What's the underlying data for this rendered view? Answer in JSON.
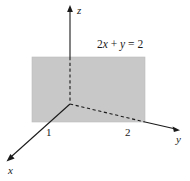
{
  "figure": {
    "kind": "3d-coordinate-plane-diagram",
    "background_color": "#ffffff",
    "ink_color": "#1a1a1a",
    "plane_fill_color": "#c8c8c8",
    "plane_edge_color": "#b4b4b4"
  },
  "axes": [
    {
      "id": "z",
      "label": "z",
      "orientation": "vertical-up",
      "solid_from": [
        70,
        104
      ],
      "solid_to": [
        70,
        57
      ],
      "dashed_from": [
        70,
        57
      ],
      "dashed_to": [
        70,
        103
      ],
      "arrow_tip": [
        70,
        6
      ],
      "label_position": [
        77,
        5
      ]
    },
    {
      "id": "y",
      "label": "y",
      "orientation": "right-down",
      "dashed_from": [
        70,
        104
      ],
      "dashed_to": [
        145,
        122
      ],
      "solid_from": [
        145,
        122
      ],
      "solid_to": [
        176,
        129
      ],
      "arrow_tip": [
        179,
        129
      ],
      "label_position": [
        176,
        134
      ]
    },
    {
      "id": "x",
      "label": "x",
      "orientation": "left-down",
      "solid_from": [
        70,
        104
      ],
      "solid_to": [
        11,
        157
      ],
      "arrow_tip": [
        7,
        161
      ],
      "label_position": [
        8,
        165
      ]
    }
  ],
  "ticks": [
    {
      "id": "x-intercept",
      "label": "1",
      "axis": "x",
      "value": 1,
      "position": [
        46,
        127
      ]
    },
    {
      "id": "y-intercept",
      "label": "2",
      "axis": "y",
      "value": 2,
      "position": [
        125,
        127
      ]
    }
  ],
  "shaded_plane": {
    "name": "plane-2x-plus-y-equals-2",
    "left": 32,
    "top": 57,
    "right": 145,
    "bottom": 122,
    "fill": "#c8c8c8"
  },
  "equation": {
    "full_text": "2x + y = 2",
    "coefficient_x": "2",
    "var_x": "x",
    "plus": "+",
    "var_y": "y",
    "equals": "=",
    "right_side": "2",
    "position": [
      97,
      39
    ]
  },
  "origin": {
    "label": "",
    "position": [
      70,
      104
    ]
  }
}
